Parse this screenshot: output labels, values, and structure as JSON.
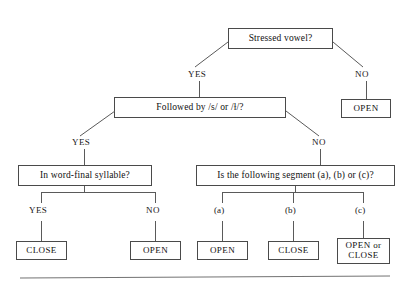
{
  "diagram": {
    "type": "decision-tree-flowchart",
    "nodes": {
      "q_stressed_vowel": "Stressed vowel?",
      "q_followed_by": "Followed by /s/ or /ɫ/?",
      "q_word_final": "In word-final syllable?",
      "q_following_segment": "Is the following segment (a), (b) or (c)?",
      "t_open_top_right": "OPEN",
      "t_close_left": "CLOSE",
      "t_open_mid": "OPEN",
      "t_open_a": "OPEN",
      "t_close_b": "CLOSE",
      "t_open_or_close_line1": "OPEN or",
      "t_open_or_close_line2": "CLOSE"
    },
    "edge_labels": {
      "root_yes": "YES",
      "root_no": "NO",
      "followed_yes": "YES",
      "followed_no": "NO",
      "wordfinal_yes": "YES",
      "wordfinal_no": "NO",
      "segment_a": "(a)",
      "segment_b": "(b)",
      "segment_c": "(c)"
    },
    "colors": {
      "box_border": "#4a4a4a",
      "connector": "#5a5a5a",
      "text": "#101010",
      "background": "#ffffff",
      "rule": "#737373"
    }
  }
}
